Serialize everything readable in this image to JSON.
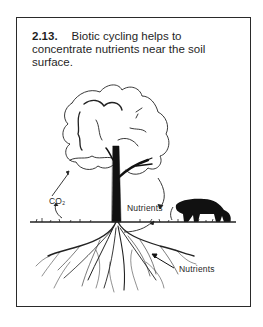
{
  "figure": {
    "number": "2.13.",
    "caption": "Biotic cycling helps to concentrate nutrients near the soil surface.",
    "labels": {
      "co2_main": "CO",
      "co2_sub": "2",
      "nutrients_upper": "Nutrients",
      "nutrients_lower": "Nutrients"
    },
    "elements": [
      "tree-canopy",
      "tree-trunk",
      "grazing-cow",
      "ground-line",
      "root-system"
    ],
    "colors": {
      "ink": "#1a1a1a",
      "frame": "#2a2a2a",
      "background": "#ffffff"
    }
  }
}
